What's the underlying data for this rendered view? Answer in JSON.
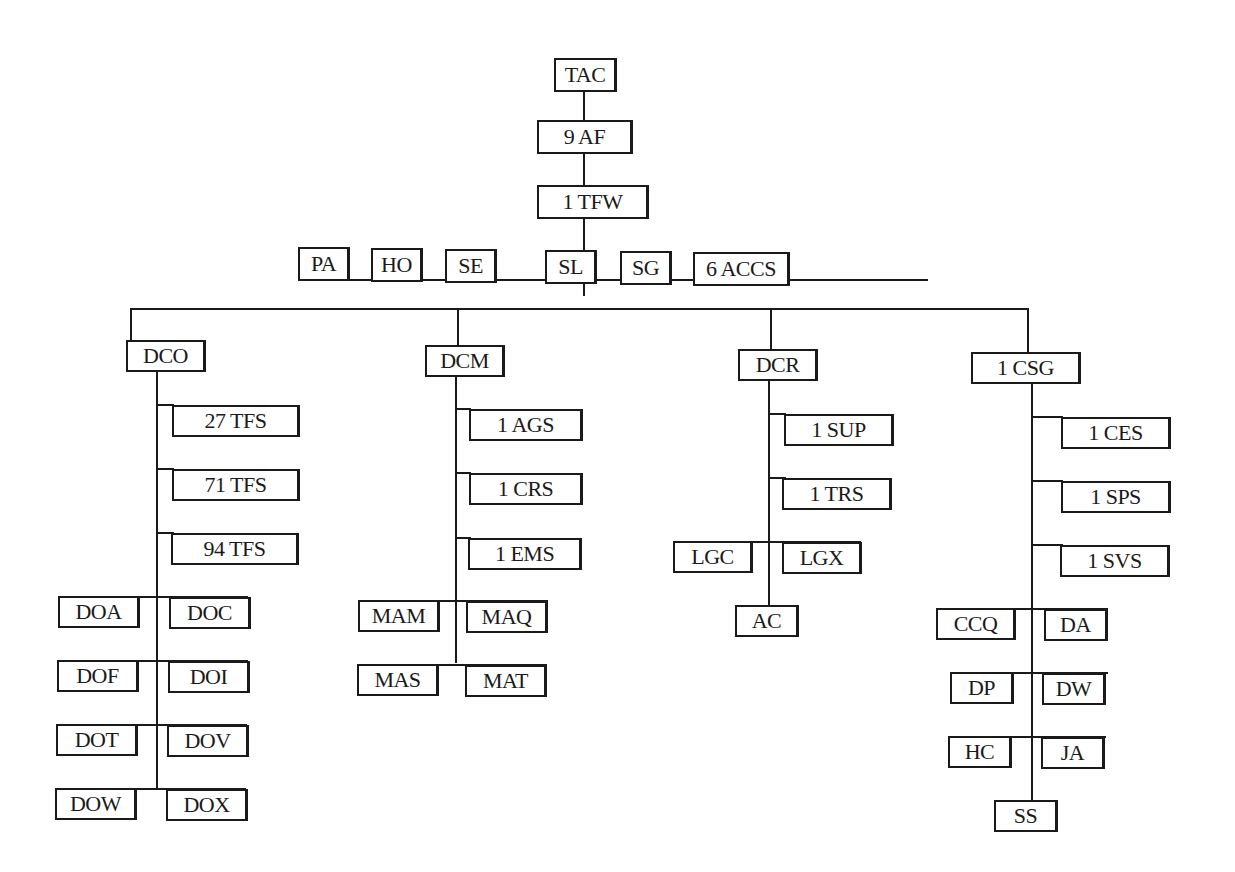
{
  "diagram": {
    "type": "organization-chart",
    "root": {
      "id": "tac",
      "label": "TAC"
    },
    "chain": [
      {
        "id": "9af",
        "label": "9 AF"
      },
      {
        "id": "1tfw",
        "label": "1 TFW"
      }
    ],
    "staff": [
      {
        "id": "pa",
        "label": "PA"
      },
      {
        "id": "ho",
        "label": "HO"
      },
      {
        "id": "se",
        "label": "SE"
      },
      {
        "id": "sl",
        "label": "SL"
      },
      {
        "id": "sg",
        "label": "SG"
      },
      {
        "id": "6accs",
        "label": "6 ACCS"
      }
    ],
    "branches": [
      {
        "id": "dco",
        "label": "DCO",
        "units": [
          {
            "label": "27 TFS"
          },
          {
            "label": "71 TFS"
          },
          {
            "label": "94 TFS"
          }
        ],
        "pairs": [
          [
            "DOA",
            "DOC"
          ],
          [
            "DOF",
            "DOI"
          ],
          [
            "DOT",
            "DOV"
          ],
          [
            "DOW",
            "DOX"
          ]
        ]
      },
      {
        "id": "dcm",
        "label": "DCM",
        "units": [
          {
            "label": "1 AGS"
          },
          {
            "label": "1 CRS"
          },
          {
            "label": "1 EMS"
          }
        ],
        "pairs": [
          [
            "MAM",
            "MAQ"
          ],
          [
            "MAS",
            "MAT"
          ]
        ]
      },
      {
        "id": "dcr",
        "label": "DCR",
        "units": [
          {
            "label": "1 SUP"
          },
          {
            "label": "1 TRS"
          }
        ],
        "pairs": [
          [
            "LGC",
            "LGX"
          ]
        ],
        "bottom": "AC"
      },
      {
        "id": "1csg",
        "label": "1 CSG",
        "units": [
          {
            "label": "1 CES"
          },
          {
            "label": "1 SPS"
          },
          {
            "label": "1 SVS"
          }
        ],
        "pairs": [
          [
            "CCQ",
            "DA"
          ],
          [
            "DP",
            "DW"
          ],
          [
            "HC",
            "JA"
          ]
        ],
        "bottom": "SS"
      }
    ]
  }
}
